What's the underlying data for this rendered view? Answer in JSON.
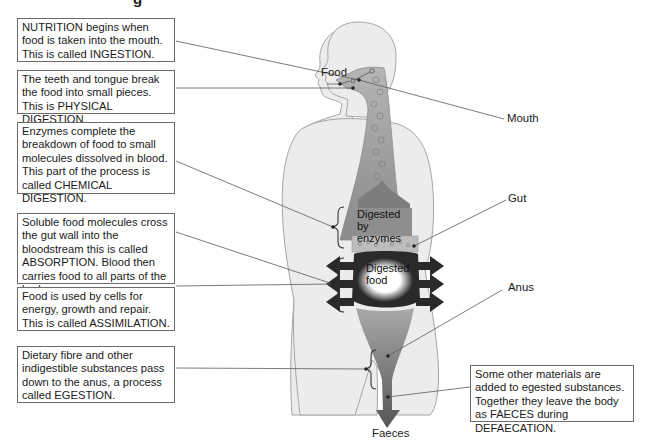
{
  "title_clipped": "g",
  "boxes": {
    "ingestion": "NUTRITION begins when food is taken into the mouth. This is called INGESTION.",
    "physical": "The teeth and tongue break the food into small pieces. This is PHYSICAL DIGESTION.",
    "chemical": "Enzymes complete the breakdown of food to small molecules dissolved in blood. This part of the process is called CHEMICAL DIGESTION.",
    "absorption": "Soluble food molecules cross the gut wall into the bloodstream this is called ABSORPTION. Blood then carries food to all parts of the body.",
    "assimilation": "Food is used by cells for energy, growth and repair. This is called ASSIMILATION.",
    "egestion": "Dietary fibre and other indigestible substances pass down to the anus, a process called EGESTION.",
    "defaecation": "Some other materials are added to egested substances. Together they leave the body as FAECES during DEFAECATION."
  },
  "labels": {
    "food": "Food",
    "mouth": "Mouth",
    "gut": "Gut",
    "anus": "Anus",
    "faeces": "Faeces",
    "digested_by_enzymes": "Digested by enzymes",
    "digested_food": "Digested food"
  },
  "colors": {
    "body_fill": "#ebebeb",
    "body_outline": "#9a9a9a",
    "gut_fill": "#a8a8a8",
    "dark_arrows": "#2a2a2a",
    "leader_line": "#5a5a5a"
  }
}
